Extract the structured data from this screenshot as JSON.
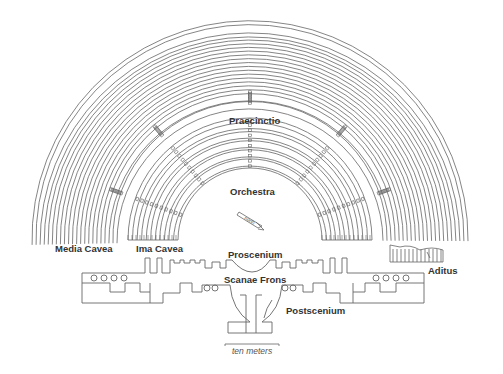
{
  "diagram": {
    "labels": {
      "praecinctio": "Praecinctio",
      "orchestra": "Orchestra",
      "media_cavea": "Media Cavea",
      "ima_cavea": "Ima Cavea",
      "proscenium": "Proscenium",
      "scanae_frons": "Scanae Frons",
      "postscenium": "Postscenium",
      "aditus": "Aditus",
      "north": "north",
      "scale": "ten meters"
    },
    "colors": {
      "line": "#555555",
      "text": "#333333",
      "background": "#ffffff"
    },
    "geometry": {
      "center": [
        250,
        240
      ],
      "media_cavea": {
        "outer_radius": 218,
        "inner_radius": 133,
        "rings": 22
      },
      "ima_cavea": {
        "outer_radius": 122,
        "inner_radius": 72,
        "rings": 12
      }
    }
  }
}
